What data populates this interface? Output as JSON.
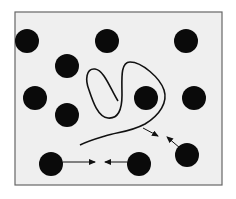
{
  "diagram": {
    "frame": {
      "x": 15,
      "y": 12,
      "width": 207,
      "height": 173,
      "fill": "#efefef",
      "stroke": "#666666"
    },
    "particle_color": "#0a0a0a",
    "particle_radius": 12,
    "particles": [
      {
        "id": "p1",
        "cx": 27,
        "cy": 41
      },
      {
        "id": "p2",
        "cx": 107,
        "cy": 41
      },
      {
        "id": "p3",
        "cx": 186,
        "cy": 41
      },
      {
        "id": "p4",
        "cx": 67,
        "cy": 66
      },
      {
        "id": "p5",
        "cx": 35,
        "cy": 98
      },
      {
        "id": "p6",
        "cx": 146,
        "cy": 98
      },
      {
        "id": "p7",
        "cx": 194,
        "cy": 98
      },
      {
        "id": "p8",
        "cx": 67,
        "cy": 115
      },
      {
        "id": "p9",
        "cx": 51,
        "cy": 164
      },
      {
        "id": "p10",
        "cx": 139,
        "cy": 164
      },
      {
        "id": "p11",
        "cx": 187,
        "cy": 155
      }
    ],
    "polymer_chain_path": "M118,101 C110,88 104,70 95,69 C86,68 85,80 89,90 C93,102 98,117 108,118 C118,119 122,110 122,95 C122,80 120,62 130,62 C142,62 160,78 164,90 C168,102 160,115 145,124 C130,132 118,132 105,136 C95,139 88,141 80,145",
    "arrows": [
      {
        "id": "a1",
        "x1": 63,
        "y1": 162,
        "x2": 95,
        "y2": 162
      },
      {
        "id": "a2",
        "x1": 127,
        "y1": 162,
        "x2": 105,
        "y2": 162
      },
      {
        "id": "a3",
        "x1": 143,
        "y1": 128,
        "x2": 158,
        "y2": 136
      },
      {
        "id": "a4",
        "x1": 180,
        "y1": 148,
        "x2": 167,
        "y2": 137
      }
    ]
  }
}
